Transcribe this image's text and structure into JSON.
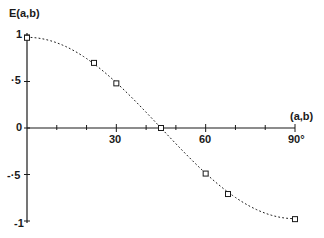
{
  "chart_data": {
    "type": "line",
    "title": "",
    "ylabel": "E(a,b)",
    "xlabel": "(a,b)",
    "x_unit": "°",
    "xlim": [
      0,
      90
    ],
    "ylim": [
      -1,
      1
    ],
    "grid": false,
    "legend": null,
    "x_ticks": [
      10,
      20,
      30,
      40,
      50,
      60,
      70,
      80,
      90
    ],
    "x_tick_labels": [
      "30",
      "60",
      "90°"
    ],
    "y_tick_labels": [
      "1",
      "·5",
      "0",
      "-·5",
      "-1"
    ],
    "series": [
      {
        "name": "measured",
        "style": "square-markers",
        "x": [
          0,
          22.5,
          30,
          45,
          60,
          67.5,
          90
        ],
        "values": [
          0.97,
          0.7,
          0.48,
          0.0,
          -0.49,
          -0.71,
          -0.98
        ]
      },
      {
        "name": "theory cos(2θ)",
        "style": "dotted-line",
        "function": "cos(2x)"
      }
    ]
  },
  "labels": {
    "y_axis_title": "E(a,b)",
    "x_axis_title": "(a,b)",
    "y1": "1",
    "y05": "·5",
    "y0": "0",
    "ym05": "-·5",
    "ym1": "-1",
    "x30": "30",
    "x60": "60",
    "x90": "90°"
  },
  "colors": {
    "ink": "#1a1a1a",
    "background": "#ffffff"
  }
}
